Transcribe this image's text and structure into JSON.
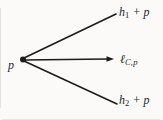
{
  "colors": {
    "ink": "#1c1c1c",
    "background": "#fbfaf8"
  },
  "diagram": {
    "point": {
      "label": "p"
    },
    "rays": {
      "h1": {
        "base": "h",
        "sub": "1",
        "suffix": " + p"
      },
      "lcp": {
        "base": "ℓ",
        "sub": "C,p",
        "suffix": ""
      },
      "h2": {
        "base": "h",
        "sub": "2",
        "suffix": " + p"
      }
    }
  }
}
